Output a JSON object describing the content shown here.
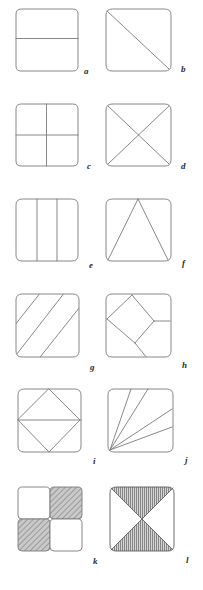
{
  "plate": {
    "title": "Plate of twelve square subdivision diagrams",
    "width": 203,
    "height": 590,
    "background_color": "#ffffff",
    "stroke_color": "#7a7a7a",
    "label_color": "#2b2b2b",
    "hatch_color": "#8c8c8c",
    "hatch_fill_color": "#b9b9b9",
    "columns": 2,
    "rows": 6,
    "square_size": 63,
    "corner_radius": 7
  },
  "figures": [
    {
      "id": "a",
      "label": "a",
      "description": "square divided by one horizontal line into two horizontal bands",
      "x": 16,
      "y": 9,
      "size": 62,
      "label_x": 84,
      "label_y": 67,
      "divisions": 2,
      "pattern": "horizontal-split",
      "hatched": false
    },
    {
      "id": "b",
      "label": "b",
      "description": "square divided by one diagonal from top-left to bottom-right",
      "x": 106,
      "y": 9,
      "size": 66,
      "label_x": 181,
      "label_y": 65,
      "divisions": 2,
      "pattern": "diagonal-split",
      "hatched": false
    },
    {
      "id": "c",
      "label": "c",
      "description": "square divided into four quadrants by one horizontal and one vertical line",
      "x": 16,
      "y": 104,
      "size": 62,
      "label_x": 87,
      "label_y": 162,
      "divisions": 4,
      "pattern": "quadrants",
      "hatched": false
    },
    {
      "id": "d",
      "label": "d",
      "description": "square divided into four triangles by both diagonals forming an X",
      "x": 106,
      "y": 104,
      "size": 66,
      "label_x": 181,
      "label_y": 162,
      "divisions": 4,
      "pattern": "x-diagonals",
      "hatched": false
    },
    {
      "id": "e",
      "label": "e",
      "description": "square divided by two vertical lines into three vertical bands",
      "x": 16,
      "y": 199,
      "size": 62,
      "label_x": 89,
      "label_y": 261,
      "divisions": 3,
      "pattern": "vertical-thirds",
      "hatched": false
    },
    {
      "id": "f",
      "label": "f",
      "description": "square containing a triangle from top-centre to the two bottom corners",
      "x": 106,
      "y": 199,
      "size": 66,
      "label_x": 182,
      "label_y": 259,
      "divisions": 3,
      "pattern": "inscribed-triangle",
      "hatched": false
    },
    {
      "id": "g",
      "label": "g",
      "description": "square crossed by three parallel diagonal stripes rising to the right",
      "x": 16,
      "y": 294,
      "size": 64,
      "label_x": 90,
      "label_y": 363,
      "divisions": 4,
      "pattern": "diagonal-stripes",
      "hatched": false
    },
    {
      "id": "h",
      "label": "h",
      "description": "square with a pinwheel of an inclined inner square and two offset diagonals",
      "x": 106,
      "y": 294,
      "size": 66,
      "label_x": 182,
      "label_y": 361,
      "divisions": 5,
      "pattern": "pinwheel",
      "hatched": false
    },
    {
      "id": "i",
      "label": "i",
      "description": "square with an inscribed diamond crossed by a horizontal midline",
      "x": 18,
      "y": 389,
      "size": 64,
      "label_x": 93,
      "label_y": 457,
      "divisions": 6,
      "pattern": "diamond-with-midline",
      "hatched": false
    },
    {
      "id": "j",
      "label": "j",
      "description": "square with a fan of four lines radiating from the bottom-left corner",
      "x": 108,
      "y": 389,
      "size": 66,
      "label_x": 185,
      "label_y": 456,
      "divisions": 5,
      "pattern": "corner-fan",
      "hatched": false
    },
    {
      "id": "k",
      "label": "k",
      "description": "four separate small squares in checkerboard arrangement, top-right and bottom-left shaded",
      "x": 19,
      "y": 488,
      "size": 66,
      "label_x": 93,
      "label_y": 557,
      "divisions": 4,
      "pattern": "checkerboard",
      "hatched": true
    },
    {
      "id": "l",
      "label": "l",
      "description": "square divided by both diagonals with the top and bottom triangles shaded",
      "x": 111,
      "y": 488,
      "size": 65,
      "label_x": 186,
      "label_y": 556,
      "divisions": 4,
      "pattern": "x-diagonals-shaded",
      "hatched": true
    }
  ]
}
